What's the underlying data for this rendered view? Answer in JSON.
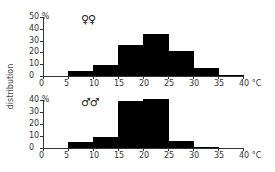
{
  "chart_data": [
    {
      "type": "bar",
      "title": "♀♀",
      "subtitle": "females",
      "xlabel": "°C",
      "ylabel": "distribution",
      "y_unit": "%",
      "bin_edges": [
        0,
        5,
        10,
        15,
        20,
        25,
        30,
        35,
        40
      ],
      "categories": [
        "5-10",
        "10-15",
        "15-20",
        "20-25",
        "25-30",
        "30-35",
        "35-40"
      ],
      "values": [
        4,
        9,
        26,
        36,
        21,
        7,
        1
      ],
      "xticks": [
        "0",
        "5",
        "10",
        "15",
        "20",
        "25",
        "30",
        "35",
        "40 °C"
      ],
      "yticks": [
        "0",
        "10",
        "20",
        "30",
        "40",
        "50 %"
      ],
      "ylim": [
        0,
        50
      ],
      "xlim": [
        0,
        40
      ],
      "grid": false
    },
    {
      "type": "bar",
      "title": "♂♂",
      "subtitle": "males",
      "xlabel": "°C",
      "ylabel": "distribution",
      "y_unit": "%",
      "bin_edges": [
        0,
        5,
        10,
        15,
        20,
        25,
        30,
        35,
        40
      ],
      "categories": [
        "5-10",
        "10-15",
        "15-20",
        "20-25",
        "25-30",
        "30-35",
        "35-40"
      ],
      "values": [
        5,
        9,
        39,
        41,
        6,
        1,
        0
      ],
      "xticks": [
        "0",
        "5",
        "10",
        "15",
        "20",
        "25",
        "30",
        "35",
        "40 °C"
      ],
      "yticks": [
        "0",
        "10",
        "20",
        "30",
        "40 %"
      ],
      "ylim": [
        0,
        40
      ],
      "xlim": [
        0,
        40
      ],
      "grid": false
    }
  ],
  "labels": {
    "shared_ylabel": "distribution",
    "female_symbol": "♀♀",
    "male_symbol": "♂♂",
    "percent": "%",
    "x_unit_last": "40 °C"
  }
}
